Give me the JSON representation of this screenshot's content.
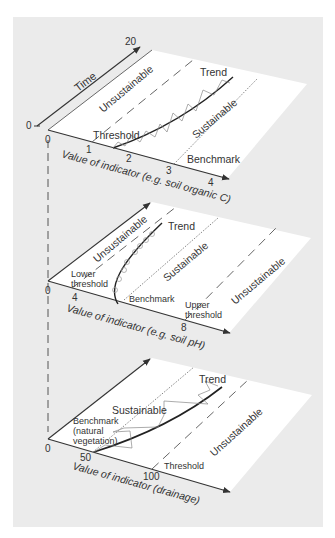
{
  "figure": {
    "background_color": "#ebebeb",
    "plane_color": "#ffffff",
    "line_color": "#333333",
    "time_axis": {
      "label": "Time",
      "start": "0",
      "end": "20"
    },
    "panels": [
      {
        "id": "top",
        "x_axis_label": "Value of indicator (e.g. soil organic C)",
        "ticks": [
          "0",
          "1",
          "2",
          "3",
          "4"
        ],
        "zone_labels": {
          "left": "Unsustainable",
          "right": "Sustainable"
        },
        "line_labels": {
          "threshold": "Threshold",
          "benchmark": "Benchmark",
          "trend": "Trend"
        }
      },
      {
        "id": "middle",
        "x_axis_label": "Value of indicator (e.g. soil pH)",
        "ticks": [
          "0",
          "4",
          "8"
        ],
        "zone_labels": {
          "left": "Unsustainable",
          "middle": "Sustainable",
          "right": "Unsustainable"
        },
        "line_labels": {
          "lower_threshold_1": "Lower",
          "lower_threshold_2": "threshold",
          "benchmark": "Benchmark",
          "upper_threshold_1": "Upper",
          "upper_threshold_2": "threshold",
          "trend": "Trend"
        }
      },
      {
        "id": "bottom",
        "x_axis_label": "Value of indicator (drainage)",
        "ticks": [
          "0",
          "50",
          "100"
        ],
        "zone_labels": {
          "left": "Sustainable",
          "right": "Unsustainable"
        },
        "line_labels": {
          "benchmark_1": "Benchmark",
          "benchmark_2": "(natural",
          "benchmark_3": "vegetation)",
          "threshold": "Threshold",
          "trend": "Trend"
        }
      }
    ]
  }
}
